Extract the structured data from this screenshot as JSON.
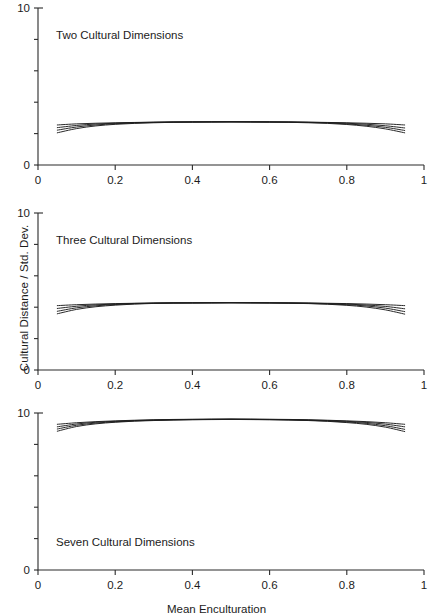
{
  "figure": {
    "ylabel": "Cultural Distance / Std. Dev.",
    "xlabel": "Mean Enculturation"
  },
  "chart_data": {
    "type": "line",
    "title": "",
    "xlabel": "Mean Enculturation",
    "ylabel": "Cultural Distance / Std. Dev.",
    "xlim": [
      0,
      1
    ],
    "ylim": [
      0,
      10
    ],
    "xticks": [
      0,
      0.2,
      0.4,
      0.6,
      0.8,
      1
    ],
    "xticklabels": [
      "0",
      "0.2",
      "0.4",
      "0.6",
      "0.8",
      "1"
    ],
    "yticks": [
      0,
      2,
      4,
      6,
      8,
      10
    ],
    "yticklabels": [
      "0",
      "",
      "",
      "",
      "",
      "10"
    ],
    "grid": false,
    "legend": "none",
    "panels": [
      {
        "title": "Two Cultural Dimensions",
        "x": [
          0.05,
          0.1,
          0.15,
          0.2,
          0.25,
          0.3,
          0.35,
          0.4,
          0.45,
          0.5,
          0.55,
          0.6,
          0.65,
          0.7,
          0.75,
          0.8,
          0.85,
          0.9,
          0.95
        ],
        "series": [
          {
            "name": "curve-1",
            "values": [
              2.55,
              2.62,
              2.66,
              2.69,
              2.71,
              2.73,
              2.74,
              2.75,
              2.75,
              2.76,
              2.75,
              2.75,
              2.74,
              2.73,
              2.71,
              2.69,
              2.66,
              2.62,
              2.55
            ]
          },
          {
            "name": "curve-2",
            "values": [
              2.38,
              2.52,
              2.61,
              2.66,
              2.7,
              2.72,
              2.74,
              2.74,
              2.75,
              2.75,
              2.75,
              2.74,
              2.74,
              2.72,
              2.7,
              2.66,
              2.6,
              2.5,
              2.36
            ]
          },
          {
            "name": "curve-3",
            "values": [
              2.22,
              2.42,
              2.55,
              2.63,
              2.68,
              2.71,
              2.73,
              2.74,
              2.74,
              2.75,
              2.74,
              2.74,
              2.73,
              2.71,
              2.68,
              2.62,
              2.53,
              2.4,
              2.2
            ]
          },
          {
            "name": "curve-4",
            "values": [
              2.05,
              2.32,
              2.49,
              2.59,
              2.65,
              2.69,
              2.72,
              2.73,
              2.74,
              2.74,
              2.74,
              2.73,
              2.72,
              2.69,
              2.65,
              2.58,
              2.47,
              2.3,
              2.05
            ]
          }
        ]
      },
      {
        "title": "Three Cultural Dimensions",
        "x": [
          0.05,
          0.1,
          0.15,
          0.2,
          0.25,
          0.3,
          0.35,
          0.4,
          0.45,
          0.5,
          0.55,
          0.6,
          0.65,
          0.7,
          0.75,
          0.8,
          0.85,
          0.9,
          0.95
        ],
        "series": [
          {
            "name": "curve-1",
            "values": [
              4.1,
              4.16,
              4.2,
              4.23,
              4.25,
              4.27,
              4.28,
              4.28,
              4.29,
              4.29,
              4.29,
              4.28,
              4.28,
              4.27,
              4.25,
              4.23,
              4.2,
              4.16,
              4.1
            ]
          },
          {
            "name": "curve-2",
            "values": [
              3.92,
              4.06,
              4.15,
              4.2,
              4.24,
              4.26,
              4.27,
              4.28,
              4.28,
              4.29,
              4.28,
              4.28,
              4.27,
              4.26,
              4.23,
              4.2,
              4.14,
              4.05,
              3.9
            ]
          },
          {
            "name": "curve-3",
            "values": [
              3.74,
              3.96,
              4.09,
              4.17,
              4.22,
              4.25,
              4.27,
              4.27,
              4.28,
              4.28,
              4.28,
              4.27,
              4.26,
              4.24,
              4.21,
              4.16,
              4.08,
              3.94,
              3.72
            ]
          },
          {
            "name": "curve-4",
            "values": [
              3.58,
              3.86,
              4.03,
              4.13,
              4.2,
              4.24,
              4.26,
              4.27,
              4.27,
              4.28,
              4.27,
              4.27,
              4.25,
              4.23,
              4.19,
              4.12,
              4.01,
              3.83,
              3.56
            ]
          }
        ]
      },
      {
        "title": "Seven Cultural Dimensions",
        "x": [
          0.05,
          0.1,
          0.15,
          0.2,
          0.25,
          0.3,
          0.35,
          0.4,
          0.45,
          0.5,
          0.55,
          0.6,
          0.65,
          0.7,
          0.75,
          0.8,
          0.85,
          0.9,
          0.95
        ],
        "series": [
          {
            "name": "curve-1",
            "values": [
              9.28,
              9.38,
              9.45,
              9.5,
              9.54,
              9.57,
              9.59,
              9.6,
              9.61,
              9.61,
              9.61,
              9.6,
              9.59,
              9.57,
              9.54,
              9.5,
              9.45,
              9.38,
              9.28
            ]
          },
          {
            "name": "curve-2",
            "values": [
              9.12,
              9.3,
              9.41,
              9.47,
              9.52,
              9.55,
              9.58,
              9.59,
              9.6,
              9.61,
              9.6,
              9.59,
              9.58,
              9.55,
              9.52,
              9.47,
              9.4,
              9.29,
              9.12
            ]
          },
          {
            "name": "curve-3",
            "values": [
              8.98,
              9.22,
              9.36,
              9.44,
              9.5,
              9.54,
              9.56,
              9.58,
              9.59,
              9.6,
              9.59,
              9.58,
              9.56,
              9.54,
              9.49,
              9.43,
              9.34,
              9.19,
              8.96
            ]
          },
          {
            "name": "curve-4",
            "values": [
              8.84,
              9.14,
              9.31,
              9.41,
              9.48,
              9.52,
              9.55,
              9.57,
              9.58,
              9.59,
              9.58,
              9.57,
              9.55,
              9.52,
              9.47,
              9.39,
              9.28,
              9.1,
              8.82
            ]
          }
        ]
      }
    ]
  }
}
